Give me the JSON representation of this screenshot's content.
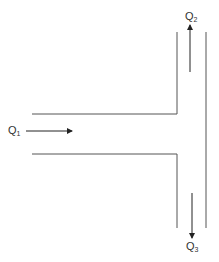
{
  "diagram": {
    "type": "T-junction flow split",
    "colors": {
      "line": "#555555",
      "arrow": "#222222",
      "text": "#333333"
    },
    "flows": [
      {
        "id": "inlet",
        "symbol": "Q",
        "subscript": "1",
        "direction": "right"
      },
      {
        "id": "outlet_up",
        "symbol": "Q",
        "subscript": "2",
        "direction": "up"
      },
      {
        "id": "outlet_down",
        "symbol": "Q",
        "subscript": "3",
        "direction": "down"
      }
    ]
  }
}
